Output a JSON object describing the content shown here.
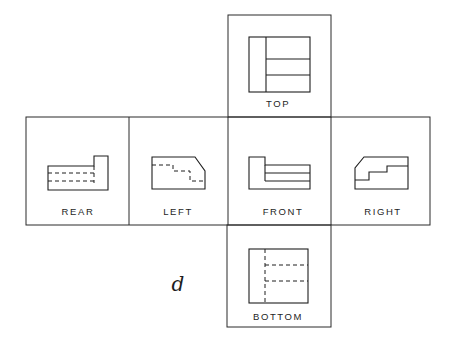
{
  "figure": {
    "caption_letter": "d",
    "views": [
      {
        "id": "top",
        "label": "TOP"
      },
      {
        "id": "rear",
        "label": "REAR"
      },
      {
        "id": "left",
        "label": "LEFT"
      },
      {
        "id": "front",
        "label": "FRONT"
      },
      {
        "id": "right",
        "label": "RIGHT"
      },
      {
        "id": "bottom",
        "label": "BOTTOM"
      }
    ]
  },
  "colors": {
    "line": "#1e1e1e",
    "background": "#ffffff"
  }
}
